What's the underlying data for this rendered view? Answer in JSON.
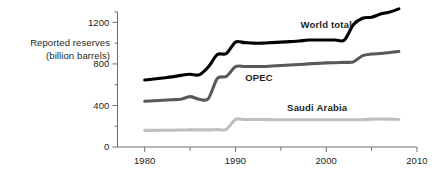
{
  "chart_data": {
    "type": "line",
    "title": "",
    "subtitle": "",
    "xlabel": "",
    "ylabel": "Reported reserves (billion barrels)",
    "ylabel_line1": "Reported reserves",
    "ylabel_line2": "(billion barrels)",
    "xlim": [
      1977,
      2010
    ],
    "ylim": [
      0,
      1300
    ],
    "axis_origin_year": 1977,
    "grid": false,
    "legend_position": "inline-annotations",
    "x_ticks_major": [
      "1980",
      "1990",
      "2000",
      "2010"
    ],
    "x_ticks_major_values": [
      1980,
      1990,
      2000,
      2010
    ],
    "x_ticks_minor_values": [
      1985,
      1995,
      2005
    ],
    "y_ticks_major": [
      "0",
      "400",
      "800",
      "1200"
    ],
    "y_ticks_major_values": [
      0,
      400,
      800,
      1200
    ],
    "y_ticks_minor_values": [
      200,
      600,
      1000,
      1300
    ],
    "series": [
      {
        "name": "World total",
        "label": "World total",
        "color": "#000000",
        "line_width": 3.1,
        "label_x": 2000.0,
        "label_y": 1150,
        "x": [
          1980,
          1981,
          1982,
          1983,
          1984,
          1985,
          1986,
          1987,
          1988,
          1989,
          1990,
          1991,
          1992,
          1993,
          1994,
          1995,
          1996,
          1997,
          1998,
          1999,
          2000,
          2001,
          2002,
          2003,
          2004,
          2005,
          2006,
          2007,
          2008
        ],
        "values": [
          645,
          655,
          665,
          675,
          690,
          700,
          695,
          770,
          890,
          900,
          1010,
          1005,
          1000,
          1000,
          1005,
          1010,
          1015,
          1020,
          1030,
          1030,
          1030,
          1030,
          1030,
          1180,
          1240,
          1250,
          1280,
          1300,
          1330
        ]
      },
      {
        "name": "OPEC",
        "label": "OPEC",
        "color": "#595959",
        "line_width": 3.1,
        "label_x": 1992.6,
        "label_y": 640,
        "x": [
          1980,
          1981,
          1982,
          1983,
          1984,
          1985,
          1986,
          1987,
          1988,
          1989,
          1990,
          1991,
          1992,
          1993,
          1994,
          1995,
          1996,
          1997,
          1998,
          1999,
          2000,
          2001,
          2002,
          2003,
          2004,
          2005,
          2006,
          2007,
          2008
        ],
        "values": [
          440,
          445,
          450,
          455,
          460,
          485,
          460,
          465,
          660,
          680,
          775,
          775,
          775,
          775,
          780,
          785,
          790,
          795,
          800,
          805,
          810,
          812,
          815,
          820,
          880,
          895,
          900,
          910,
          920
        ]
      },
      {
        "name": "Saudi Arabia",
        "label": "Saudi Arabia",
        "color": "#bfbfbf",
        "line_width": 3.1,
        "label_x": 1999.0,
        "label_y": 350,
        "x": [
          1980,
          1981,
          1982,
          1983,
          1984,
          1985,
          1986,
          1987,
          1988,
          1989,
          1990,
          1991,
          1992,
          1993,
          1994,
          1995,
          1996,
          1997,
          1998,
          1999,
          2000,
          2001,
          2002,
          2003,
          2004,
          2005,
          2006,
          2007,
          2008
        ],
        "values": [
          160,
          160,
          162,
          162,
          163,
          165,
          165,
          165,
          168,
          170,
          265,
          265,
          265,
          265,
          262,
          262,
          262,
          262,
          262,
          263,
          263,
          263,
          263,
          263,
          263,
          268,
          270,
          268,
          265
        ]
      }
    ],
    "axis_color": "#6e6e6e"
  }
}
